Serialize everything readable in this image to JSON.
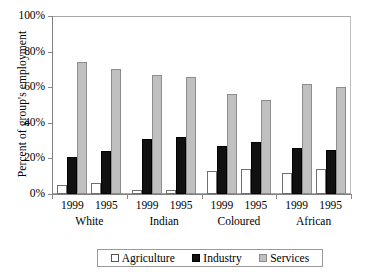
{
  "chart_data": {
    "type": "bar",
    "title": "",
    "xlabel": "",
    "ylabel": "Percent of group's employment",
    "ylim": [
      0,
      100
    ],
    "ytick_labels": [
      "100%",
      "80%",
      "60%",
      "40%",
      "20%",
      "0%"
    ],
    "ytick_values": [
      100,
      80,
      60,
      40,
      20,
      0
    ],
    "grid": false,
    "legend_position": "bottom",
    "group_labels": [
      "White",
      "Indian",
      "Coloured",
      "African"
    ],
    "categories": [
      "1999 White",
      "1995 White",
      "1999 Indian",
      "1995 Indian",
      "1999 Coloured",
      "1995 Coloured",
      "1999 African",
      "1995 African"
    ],
    "year_labels": [
      "1999",
      "1995"
    ],
    "series": [
      {
        "name": "Agriculture",
        "color": "#ffffff",
        "values": [
          5,
          6,
          2,
          2,
          13,
          14,
          12,
          14
        ]
      },
      {
        "name": "Industry",
        "color": "#111111",
        "values": [
          21,
          24,
          31,
          32,
          27,
          29,
          26,
          25
        ]
      },
      {
        "name": "Services",
        "color": "#c0c0c0",
        "values": [
          74,
          70,
          67,
          66,
          56,
          53,
          62,
          60
        ]
      }
    ],
    "groups": [
      {
        "label": "White",
        "bars": [
          {
            "year": "1999",
            "agriculture": 5,
            "industry": 21,
            "services": 74
          },
          {
            "year": "1995",
            "agriculture": 6,
            "industry": 24,
            "services": 70
          }
        ]
      },
      {
        "label": "Indian",
        "bars": [
          {
            "year": "1999",
            "agriculture": 2,
            "industry": 31,
            "services": 67
          },
          {
            "year": "1995",
            "agriculture": 2,
            "industry": 32,
            "services": 66
          }
        ]
      },
      {
        "label": "Coloured",
        "bars": [
          {
            "year": "1999",
            "agriculture": 13,
            "industry": 27,
            "services": 56
          },
          {
            "year": "1995",
            "agriculture": 14,
            "industry": 29,
            "services": 53
          }
        ]
      },
      {
        "label": "African",
        "bars": [
          {
            "year": "1999",
            "agriculture": 12,
            "industry": 26,
            "services": 62
          },
          {
            "year": "1995",
            "agriculture": 14,
            "industry": 25,
            "services": 60
          }
        ]
      }
    ],
    "legend": [
      {
        "label": "Agriculture",
        "swatch": "agriculture"
      },
      {
        "label": "Industry",
        "swatch": "industry"
      },
      {
        "label": "Services",
        "swatch": "services"
      }
    ]
  }
}
